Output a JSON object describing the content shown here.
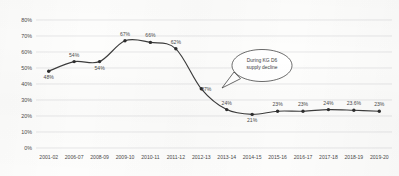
{
  "chart_data": {
    "type": "line",
    "title": "",
    "subtitle": "",
    "xlabel": "",
    "ylabel": "",
    "ylim": [
      0,
      80
    ],
    "ytick_labels": [
      "0%",
      "10%",
      "20%",
      "30%",
      "40%",
      "50%",
      "60%",
      "70%",
      "80%"
    ],
    "ytick_values": [
      0,
      10,
      20,
      30,
      40,
      50,
      60,
      70,
      80
    ],
    "grid": true,
    "legend": "none",
    "categories": [
      "2001-02",
      "2006-07",
      "2008-09",
      "2009-10",
      "2010-11",
      "2011-12",
      "2012-13",
      "2013-14",
      "2014-15",
      "2015-16",
      "2016-17",
      "2017-18",
      "2018-19",
      "2019-20"
    ],
    "values": [
      48,
      54,
      54,
      67,
      66,
      62,
      37,
      24,
      21,
      23,
      23,
      24,
      23.6,
      23
    ],
    "point_labels": [
      "48%",
      "54%",
      "54%",
      "67%",
      "66%",
      "62%",
      "37%",
      "24%",
      "21%",
      "23%",
      "23%",
      "24%",
      "23.6%",
      "23%"
    ],
    "label_positions": [
      "below",
      "above",
      "below",
      "above",
      "above",
      "above",
      "right",
      "above",
      "below",
      "above",
      "above",
      "above",
      "above",
      "above"
    ],
    "annotations": [
      {
        "name": "kg-d6-callout",
        "lines": [
          "During KG D6",
          "supply decline"
        ],
        "points_at_category": "2012-13"
      }
    ],
    "colors": {
      "line": "#3c3c3c",
      "marker": "#2e2e2e",
      "grid": "#d9d9d9",
      "text": "#4a4a4a",
      "background": "#fdfdfc",
      "callout_fill": "#ffffff",
      "callout_stroke": "#3a3a3a"
    }
  }
}
